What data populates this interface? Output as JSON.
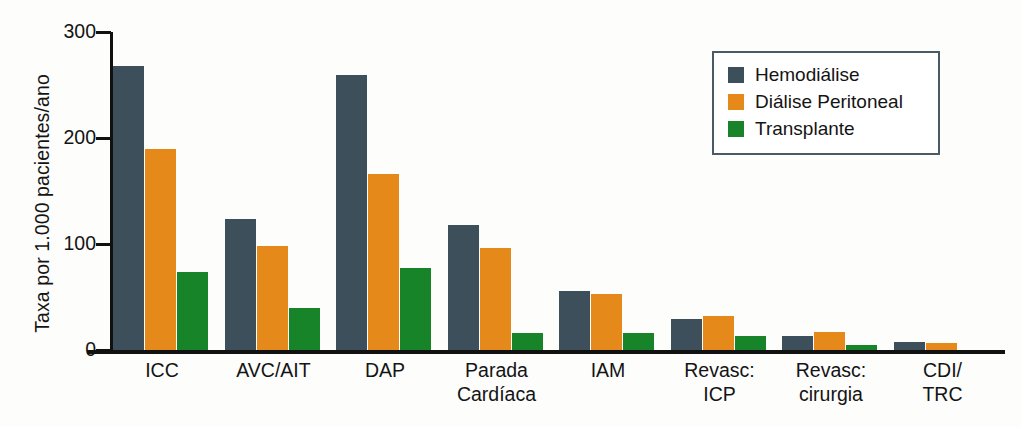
{
  "chart_data": {
    "type": "bar",
    "title": "",
    "xlabel": "",
    "ylabel": "Taxa por 1.000 pacientes/ano",
    "ylim": [
      0,
      300
    ],
    "yticks": [
      0,
      100,
      200,
      300
    ],
    "ytick_labels": [
      "0",
      "100",
      "200",
      "300"
    ],
    "grid": false,
    "legend_position": "top-right",
    "categories": [
      "ICC",
      "AVC/AIT",
      "DAP",
      "Parada\nCardíaca",
      "IAM",
      "Revasc:\nICP",
      "Revasc:\ncirurgia",
      "CDI/\nTRC"
    ],
    "series": [
      {
        "name": "Hemodiálise",
        "color": "#3d4f5a",
        "values": [
          268,
          124,
          259,
          118,
          56,
          29,
          13,
          8
        ]
      },
      {
        "name": "Diálise Peritoneal",
        "color": "#e5891b",
        "values": [
          190,
          98,
          166,
          96,
          53,
          32,
          17,
          7
        ]
      },
      {
        "name": "Transplante",
        "color": "#17842a",
        "values": [
          74,
          40,
          77,
          16,
          16,
          13,
          5,
          0
        ]
      }
    ]
  },
  "legend": {
    "items": [
      {
        "label": "Hemodiálise",
        "color": "#3d4f5a"
      },
      {
        "label": "Diálise Peritoneal",
        "color": "#e5891b"
      },
      {
        "label": "Transplante",
        "color": "#17842a"
      }
    ]
  },
  "colors": {
    "hemodialise": "#3d4f5a",
    "dialise_peritoneal": "#e5891b",
    "transplante": "#17842a",
    "axis": "#111111",
    "background": "#fdfdfc"
  }
}
